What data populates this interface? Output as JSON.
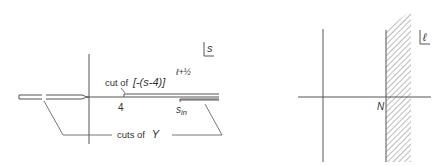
{
  "left_diagram": {
    "plane_label": "s",
    "cut_label_prefix": "cut of",
    "cut_expression": "[-(s-4)]",
    "cut_exponent": "ℓ+½",
    "branch_point": "4",
    "threshold_label": "s",
    "threshold_subscript": "in",
    "cuts_label_prefix": "cuts of",
    "cuts_label_symbol": "Y"
  },
  "right_diagram": {
    "plane_label": "ℓ",
    "boundary_label": "N"
  },
  "colors": {
    "line": "#555555",
    "text": "#333333",
    "hatch": "#777777"
  }
}
